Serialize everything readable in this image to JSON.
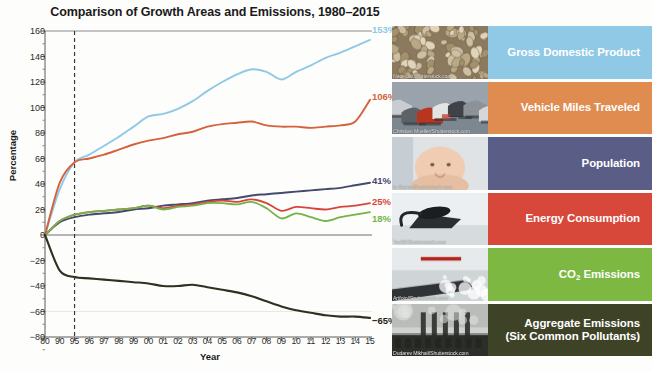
{
  "chart_data": {
    "type": "line",
    "title": "Comparison of Growth Areas and Emissions, 1980–2015",
    "xlabel": "Year",
    "ylabel": "Percentage",
    "ylim": [
      -80,
      160
    ],
    "ytick_step": 20,
    "yticks": [
      "160",
      "140",
      "120",
      "100",
      "80",
      "60",
      "40",
      "20",
      "0",
      "−20",
      "−40",
      "−60",
      "−80"
    ],
    "xticks": [
      "80",
      "90",
      "95",
      "96",
      "97",
      "98",
      "99",
      "00",
      "01",
      "02",
      "03",
      "04",
      "05",
      "06",
      "07",
      "08",
      "09",
      "10",
      "11",
      "12",
      "13",
      "14",
      "15"
    ],
    "x": [
      1980,
      1990,
      1995,
      1996,
      1997,
      1998,
      1999,
      2000,
      2001,
      2002,
      2003,
      2004,
      2005,
      2006,
      2007,
      2008,
      2009,
      2010,
      2011,
      2012,
      2013,
      2014,
      2015
    ],
    "grid": false,
    "legend_position": "right",
    "reference_line_year": 1995,
    "series": [
      {
        "name": "Gross Domestic Product",
        "color": "#8FC9E6",
        "end_label": "153%",
        "values": [
          0,
          36,
          57,
          63,
          70,
          77,
          85,
          93,
          95,
          99,
          105,
          113,
          120,
          126,
          130,
          128,
          122,
          128,
          133,
          139,
          143,
          148,
          153
        ]
      },
      {
        "name": "Vehicle Miles Traveled",
        "color": "#D4623C",
        "end_label": "106%",
        "values": [
          0,
          41,
          57,
          60,
          63,
          67,
          71,
          74,
          76,
          79,
          81,
          85,
          87,
          88,
          89,
          86,
          85,
          85,
          84,
          85,
          86,
          89,
          106
        ]
      },
      {
        "name": "Population",
        "color": "#44496E",
        "end_label": "41%",
        "values": [
          0,
          10,
          14,
          16,
          17,
          18,
          20,
          21,
          23,
          24,
          25,
          27,
          28,
          29,
          31,
          32,
          33,
          34,
          35,
          36,
          37,
          39,
          41
        ]
      },
      {
        "name": "Energy Consumption",
        "color": "#D8443C",
        "end_label": "25%",
        "values": [
          0,
          11,
          16,
          18,
          19,
          20,
          21,
          23,
          21,
          23,
          24,
          26,
          27,
          26,
          28,
          25,
          19,
          22,
          21,
          20,
          22,
          23,
          25
        ]
      },
      {
        "name": "CO₂ Emissions",
        "color": "#74B34A",
        "end_label": "18%",
        "values": [
          0,
          11,
          16,
          18,
          19,
          20,
          21,
          23,
          20,
          22,
          23,
          25,
          25,
          24,
          26,
          21,
          13,
          17,
          14,
          11,
          14,
          16,
          18
        ]
      },
      {
        "name": "Aggregate Emissions (Six Common Pollutants)",
        "color": "#2E3120",
        "end_label": "−65%",
        "values": [
          0,
          -28,
          -33,
          -34,
          -35,
          -36,
          -37,
          -38,
          -40,
          -40,
          -39,
          -41,
          -43,
          -45,
          -48,
          -52,
          -56,
          -59,
          -61,
          -63,
          -64,
          -64,
          -65
        ]
      }
    ]
  },
  "legend": {
    "rows": [
      {
        "label": "Gross Domestic Product",
        "color": "#8FC9E6",
        "photo": "coins-photo",
        "credit": "Nata-Lia/Shutterstock.com"
      },
      {
        "label": "Vehicle Miles Traveled",
        "color": "#E08B4F",
        "photo": "traffic-photo",
        "credit": "Christian Mueller/Shutterstock.com"
      },
      {
        "label": "Population",
        "color": "#5A5E87",
        "photo": "baby-photo",
        "credit": "In Green/Shutterstock.com"
      },
      {
        "label": "Energy Consumption",
        "color": "#D8483A",
        "photo": "iron-photo",
        "credit": "Tsv55/Shutterstock.com"
      },
      {
        "label": "CO2 Emissions",
        "label_main": "CO",
        "label_sub": "2",
        "label_rest": " Emissions",
        "color": "#7CB842",
        "photo": "exhaust-photo",
        "credit": "Artfoto/Shutterstock.com"
      },
      {
        "label": "Aggregate Emissions",
        "label_line2": "(Six Common Pollutants)",
        "color": "#3E4327",
        "photo": "smokestacks-photo",
        "credit": "Dudarev Mikhail/Shutterstock.com"
      }
    ]
  }
}
